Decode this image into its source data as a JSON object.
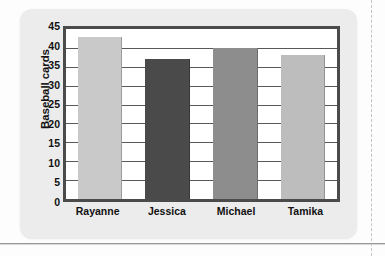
{
  "chart_data": {
    "type": "bar",
    "title": "",
    "xlabel": "",
    "ylabel": "Baseball cards",
    "categories": [
      "Rayanne",
      "Jessica",
      "Michael",
      "Tamika"
    ],
    "values": [
      43,
      37,
      40,
      38
    ],
    "series": [
      {
        "name": "Baseball cards",
        "values": [
          43,
          37,
          40,
          38
        ]
      }
    ],
    "bar_colors": [
      "#c9c9c9",
      "#4a4a4a",
      "#8d8d8d",
      "#bdbdbd"
    ],
    "ylim": [
      0,
      45
    ],
    "ytick_step": 5,
    "yticks": [
      45,
      40,
      35,
      30,
      25,
      20,
      15,
      10,
      5,
      0
    ],
    "grid": true,
    "legend": "none",
    "axis_color": "#4b4b4b",
    "plot_background": "#ffffff",
    "card_background": "#ececec"
  }
}
